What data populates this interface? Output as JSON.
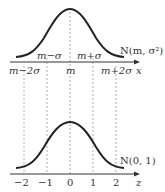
{
  "diagram": {
    "top": {
      "label": "N(m, σ²)",
      "axis_var": "x",
      "upper_ticks": [
        "m−σ",
        "m+σ"
      ],
      "lower_ticks": [
        "m−2σ",
        "m",
        "m+2σ"
      ]
    },
    "bottom": {
      "label": "N(0, 1)",
      "axis_var": "z",
      "ticks": [
        "−2",
        "−1",
        "0",
        "1",
        "2"
      ]
    },
    "colors": {
      "curve": "#222222",
      "axis": "#333333",
      "dashed": "#888888"
    }
  }
}
